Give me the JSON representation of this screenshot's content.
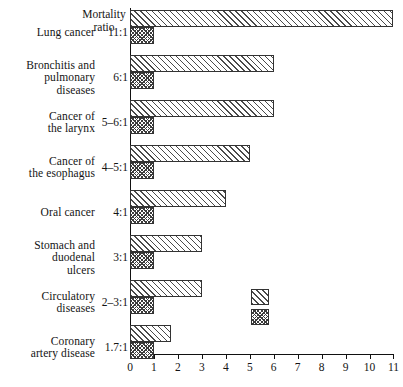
{
  "chart_data": {
    "type": "bar",
    "orientation": "horizontal",
    "title": "",
    "xlabel": "",
    "ylabel": "",
    "xlim": [
      0,
      11
    ],
    "xticks": [
      "0",
      "1",
      "2",
      "3",
      "4",
      "5",
      "6",
      "7",
      "8",
      "9",
      "10",
      "11"
    ],
    "grid": false,
    "legend_position": "inside-right-lower",
    "categories": [
      "Lung cancer",
      "Bronchitis and\npulmonary\ndiseases",
      "Cancer of\nthe larynx",
      "Cancer of\nthe esophagus",
      "Oral cancer",
      "Stomach and\nduodenal\nulcers",
      "Circulatory\ndiseases",
      "Coronary\nartery disease"
    ],
    "ratio_header": "Mortality\nratio",
    "ratios": [
      "11:1",
      "6:1",
      "5–6:1",
      "4–5:1",
      "4:1",
      "3:1",
      "2–3:1",
      "1.7:1"
    ],
    "series": [
      {
        "name": "hatched",
        "pattern": "diagonal-hatch",
        "values": [
          11,
          6,
          6,
          5,
          4,
          3,
          3,
          1.7
        ]
      },
      {
        "name": "checkered",
        "pattern": "cross-hatch",
        "values": [
          1,
          1,
          1,
          1,
          1,
          1,
          1,
          1
        ]
      }
    ],
    "legend_entries": [
      {
        "pattern": "diagonal-hatch",
        "label": ""
      },
      {
        "pattern": "cross-hatch",
        "label": ""
      }
    ],
    "colors": {
      "axis": "#111111",
      "bar_outline": "#333333",
      "hatch": "#4a4a4a",
      "check": "#3c3c3c",
      "background": "#ffffff",
      "text": "#141414"
    }
  }
}
